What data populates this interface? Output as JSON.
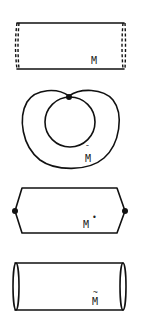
{
  "figure": {
    "panels": [
      {
        "id": "M",
        "shape": "rectangle-with-dashed-ends",
        "label": "M",
        "label_decoration": "",
        "description": "Strip (rectangle) with dashed left and right edges to be identified"
      },
      {
        "id": "M-bar",
        "shape": "cardioid-with-inner-circle",
        "label": "M",
        "label_decoration": "¯",
        "description": "Outer heart-shaped curve and inner circle touching at a single marked point"
      },
      {
        "id": "M-star",
        "shape": "hexagon-with-pinched-ends",
        "label": "M",
        "label_decoration": "•",
        "description": "Rectangle whose left and right ends are pinched to marked points"
      },
      {
        "id": "M-tilde",
        "shape": "cylinder",
        "label": "M",
        "label_decoration": "~",
        "description": "Cylinder drawn as rectangle with elliptical end caps"
      }
    ],
    "colors": {
      "ink": "#111111",
      "background": "#ffffff"
    }
  }
}
